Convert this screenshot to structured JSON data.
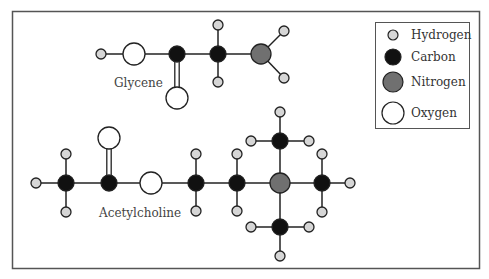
{
  "legend": {
    "items": [
      {
        "label": "Hydrogen",
        "element": "H",
        "color": "#d6d6d6",
        "r": 5
      },
      {
        "label": "Carbon",
        "element": "C",
        "color": "#111111",
        "r": 8
      },
      {
        "label": "Nitrogen",
        "element": "N",
        "color": "#707070",
        "r": 10
      },
      {
        "label": "Oxygen",
        "element": "O",
        "color": "#ffffff",
        "r": 11
      }
    ]
  },
  "molecules": [
    {
      "name": "Glycene",
      "label_pos": [
        114,
        87
      ],
      "atoms": [
        {
          "id": "g_h1",
          "el": "H",
          "x": 101,
          "y": 54
        },
        {
          "id": "g_o1",
          "el": "O",
          "x": 134,
          "y": 54
        },
        {
          "id": "g_c1",
          "el": "C",
          "x": 177,
          "y": 54
        },
        {
          "id": "g_o2",
          "el": "O",
          "x": 177,
          "y": 98
        },
        {
          "id": "g_c2",
          "el": "C",
          "x": 218,
          "y": 54
        },
        {
          "id": "g_h2",
          "el": "H",
          "x": 218,
          "y": 25
        },
        {
          "id": "g_h3",
          "el": "H",
          "x": 218,
          "y": 82
        },
        {
          "id": "g_n1",
          "el": "N",
          "x": 261,
          "y": 54
        },
        {
          "id": "g_h4",
          "el": "H",
          "x": 284,
          "y": 31
        },
        {
          "id": "g_h5",
          "el": "H",
          "x": 284,
          "y": 78
        }
      ],
      "bonds": [
        {
          "a": "g_h1",
          "b": "g_o1",
          "order": 1
        },
        {
          "a": "g_o1",
          "b": "g_c1",
          "order": 1
        },
        {
          "a": "g_c1",
          "b": "g_o2",
          "order": 2
        },
        {
          "a": "g_c1",
          "b": "g_c2",
          "order": 1
        },
        {
          "a": "g_c2",
          "b": "g_h2",
          "order": 1
        },
        {
          "a": "g_c2",
          "b": "g_h3",
          "order": 1
        },
        {
          "a": "g_c2",
          "b": "g_n1",
          "order": 1
        },
        {
          "a": "g_n1",
          "b": "g_h4",
          "order": 1
        },
        {
          "a": "g_n1",
          "b": "g_h5",
          "order": 1
        }
      ]
    },
    {
      "name": "Acetylcholine",
      "label_pos": [
        99,
        217
      ],
      "atoms": [
        {
          "id": "a_h1",
          "el": "H",
          "x": 36,
          "y": 183
        },
        {
          "id": "a_c1",
          "el": "C",
          "x": 66,
          "y": 183
        },
        {
          "id": "a_h2",
          "el": "H",
          "x": 66,
          "y": 154
        },
        {
          "id": "a_h3",
          "el": "H",
          "x": 66,
          "y": 212
        },
        {
          "id": "a_c2",
          "el": "C",
          "x": 109,
          "y": 183
        },
        {
          "id": "a_o1",
          "el": "O",
          "x": 109,
          "y": 138
        },
        {
          "id": "a_o2",
          "el": "O",
          "x": 151,
          "y": 183
        },
        {
          "id": "a_c3",
          "el": "C",
          "x": 196,
          "y": 183
        },
        {
          "id": "a_h4",
          "el": "H",
          "x": 196,
          "y": 154
        },
        {
          "id": "a_h5",
          "el": "H",
          "x": 196,
          "y": 211
        },
        {
          "id": "a_c4",
          "el": "C",
          "x": 237,
          "y": 183
        },
        {
          "id": "a_h6",
          "el": "H",
          "x": 237,
          "y": 154
        },
        {
          "id": "a_h7",
          "el": "H",
          "x": 237,
          "y": 211
        },
        {
          "id": "a_n1",
          "el": "N",
          "x": 280,
          "y": 183
        },
        {
          "id": "a_c5",
          "el": "C",
          "x": 280,
          "y": 141
        },
        {
          "id": "a_h8",
          "el": "H",
          "x": 280,
          "y": 112
        },
        {
          "id": "a_h9",
          "el": "H",
          "x": 251,
          "y": 141
        },
        {
          "id": "a_h10",
          "el": "H",
          "x": 309,
          "y": 141
        },
        {
          "id": "a_c6",
          "el": "C",
          "x": 322,
          "y": 183
        },
        {
          "id": "a_h11",
          "el": "H",
          "x": 350,
          "y": 183
        },
        {
          "id": "a_h12",
          "el": "H",
          "x": 322,
          "y": 154
        },
        {
          "id": "a_h13",
          "el": "H",
          "x": 322,
          "y": 212
        },
        {
          "id": "a_c7",
          "el": "C",
          "x": 280,
          "y": 227
        },
        {
          "id": "a_h14",
          "el": "H",
          "x": 251,
          "y": 227
        },
        {
          "id": "a_h15",
          "el": "H",
          "x": 309,
          "y": 227
        },
        {
          "id": "a_h16",
          "el": "H",
          "x": 280,
          "y": 256
        }
      ],
      "bonds": [
        {
          "a": "a_h1",
          "b": "a_c1",
          "order": 1
        },
        {
          "a": "a_c1",
          "b": "a_h2",
          "order": 1
        },
        {
          "a": "a_c1",
          "b": "a_h3",
          "order": 1
        },
        {
          "a": "a_c1",
          "b": "a_c2",
          "order": 1
        },
        {
          "a": "a_c2",
          "b": "a_o1",
          "order": 2
        },
        {
          "a": "a_c2",
          "b": "a_o2",
          "order": 1
        },
        {
          "a": "a_o2",
          "b": "a_c3",
          "order": 1
        },
        {
          "a": "a_c3",
          "b": "a_h4",
          "order": 1
        },
        {
          "a": "a_c3",
          "b": "a_h5",
          "order": 1
        },
        {
          "a": "a_c3",
          "b": "a_c4",
          "order": 1
        },
        {
          "a": "a_c4",
          "b": "a_h6",
          "order": 1
        },
        {
          "a": "a_c4",
          "b": "a_h7",
          "order": 1
        },
        {
          "a": "a_c4",
          "b": "a_n1",
          "order": 1
        },
        {
          "a": "a_n1",
          "b": "a_c5",
          "order": 1
        },
        {
          "a": "a_c5",
          "b": "a_h8",
          "order": 1
        },
        {
          "a": "a_c5",
          "b": "a_h9",
          "order": 1
        },
        {
          "a": "a_c5",
          "b": "a_h10",
          "order": 1
        },
        {
          "a": "a_n1",
          "b": "a_c6",
          "order": 1
        },
        {
          "a": "a_c6",
          "b": "a_h11",
          "order": 1
        },
        {
          "a": "a_c6",
          "b": "a_h12",
          "order": 1
        },
        {
          "a": "a_c6",
          "b": "a_h13",
          "order": 1
        },
        {
          "a": "a_n1",
          "b": "a_c7",
          "order": 1
        },
        {
          "a": "a_c7",
          "b": "a_h14",
          "order": 1
        },
        {
          "a": "a_c7",
          "b": "a_h15",
          "order": 1
        },
        {
          "a": "a_c7",
          "b": "a_h16",
          "order": 1
        }
      ]
    }
  ]
}
